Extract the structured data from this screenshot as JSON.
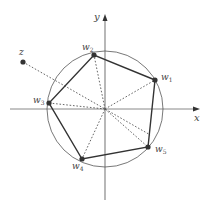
{
  "diagram": {
    "axes": {
      "origin": [
        105,
        109
      ],
      "x_label": "x",
      "y_label": "y",
      "x_start": 10,
      "x_end": 196,
      "y_start": 200,
      "y_end": 18,
      "color": "#888888"
    },
    "circle": {
      "cx": 105,
      "cy": 109,
      "r": 58,
      "color": "#555555"
    },
    "points": [
      {
        "id": "w1",
        "label": "w",
        "sub": "1",
        "x": 155,
        "y": 80,
        "lx": 161,
        "ly": 80
      },
      {
        "id": "w2",
        "label": "w",
        "sub": "2",
        "x": 94,
        "y": 55,
        "lx": 82,
        "ly": 50
      },
      {
        "id": "w3",
        "label": "w",
        "sub": "3",
        "x": 49,
        "y": 103,
        "lx": 33,
        "ly": 103
      },
      {
        "id": "w4",
        "label": "w",
        "sub": "4",
        "x": 82,
        "y": 159,
        "lx": 72,
        "ly": 169
      },
      {
        "id": "w5",
        "label": "w",
        "sub": "5",
        "x": 148,
        "y": 147,
        "lx": 155,
        "ly": 152
      },
      {
        "id": "z",
        "label": "z",
        "sub": "",
        "x": 23,
        "y": 62,
        "lx": 19,
        "ly": 55
      }
    ],
    "pentagon_order": [
      "w1",
      "w2",
      "w3",
      "w4",
      "w5"
    ],
    "polygon_color": "#333333",
    "dotted_color": "#555555",
    "point_color": "#333333"
  }
}
